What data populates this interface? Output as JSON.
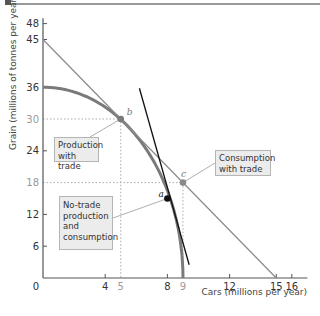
{
  "chart_data": {
    "type": "line",
    "title": "",
    "xlabel": "Cars (millions per year)",
    "ylabel": "Grain (millions of tonnes per year)",
    "xlim": [
      0,
      17
    ],
    "ylim": [
      0,
      49
    ],
    "x_ticks": [
      {
        "value": 0,
        "label": "0",
        "highlight": false
      },
      {
        "value": 4,
        "label": "4",
        "highlight": false
      },
      {
        "value": 5,
        "label": "5",
        "highlight": true
      },
      {
        "value": 8,
        "label": "8",
        "highlight": false
      },
      {
        "value": 9,
        "label": "9",
        "highlight": true
      },
      {
        "value": 12,
        "label": "12",
        "highlight": false
      },
      {
        "value": 15,
        "label": "15",
        "highlight": false
      },
      {
        "value": 16,
        "label": "16",
        "highlight": false
      }
    ],
    "y_ticks": [
      {
        "value": 6,
        "label": "6",
        "highlight": false
      },
      {
        "value": 12,
        "label": "12",
        "highlight": false
      },
      {
        "value": 18,
        "label": "18",
        "highlight": true
      },
      {
        "value": 24,
        "label": "24",
        "highlight": false
      },
      {
        "value": 30,
        "label": "30",
        "highlight": true
      },
      {
        "value": 36,
        "label": "36",
        "highlight": false
      },
      {
        "value": 45,
        "label": "45",
        "highlight": false
      },
      {
        "value": 48,
        "label": "48",
        "highlight": false
      }
    ],
    "series": [
      {
        "name": "Production possibilities frontier",
        "kind": "curve",
        "color": "#7a7a7a",
        "intercepts": {
          "y": 36,
          "x": 9
        }
      },
      {
        "name": "Trade line",
        "kind": "line",
        "color": "#8a8a8a",
        "points": [
          [
            0,
            45
          ],
          [
            15,
            0
          ]
        ]
      },
      {
        "name": "No-trade price line (tangent at a)",
        "kind": "line",
        "color": "#111111",
        "points": [
          [
            6.2,
            35.8
          ],
          [
            9.4,
            2.5
          ]
        ]
      }
    ],
    "points": [
      {
        "id": "a",
        "x": 8,
        "y": 15,
        "color": "#111111",
        "label": "a"
      },
      {
        "id": "b",
        "x": 5,
        "y": 30,
        "color": "#7a7a7a",
        "label": "b"
      },
      {
        "id": "c",
        "x": 9,
        "y": 18,
        "color": "#8a8a8a",
        "label": "c"
      }
    ],
    "annotations": [
      {
        "text": "Production with trade",
        "points_to": "b"
      },
      {
        "text": "Consumption with trade",
        "points_to": "c"
      },
      {
        "text": "No-trade production and consumption",
        "points_to": "a"
      }
    ],
    "grid": false,
    "guides": "dotted lines from b and c to axes"
  },
  "labels": {
    "b_callout_line1": "Production",
    "b_callout_line2": "with trade",
    "c_callout_line1": "Consumption",
    "c_callout_line2": "with trade",
    "a_callout_line1": "No-trade",
    "a_callout_line2": "production",
    "a_callout_line3": "and",
    "a_callout_line4": "consumption"
  }
}
